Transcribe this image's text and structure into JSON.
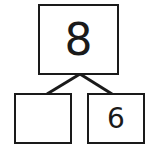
{
  "number_bond": {
    "whole": "8",
    "part_left": "",
    "part_right": "6"
  },
  "colors": {
    "stroke": "#1a1a1a",
    "background": "#ffffff"
  }
}
